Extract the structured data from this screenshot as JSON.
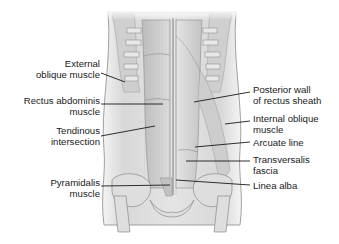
{
  "diagram": {
    "colors": {
      "background": "#ffffff",
      "muscle_light": "#e6e6e6",
      "muscle_mid": "#c9c9c9",
      "muscle_dark": "#9a9a9a",
      "outline": "#7a7a7a",
      "leader_line": "#1a1a1a",
      "text": "#1a1a1a"
    },
    "left_labels": [
      {
        "line1": "External",
        "line2": "oblique muscle"
      },
      {
        "line1": "Rectus abdominis",
        "line2": "muscle"
      },
      {
        "line1": "Tendinous",
        "line2": "intersection"
      },
      {
        "line1": "Pyramidalis",
        "line2": "muscle"
      }
    ],
    "right_labels": [
      {
        "line1": "Posterior wall",
        "line2": "of rectus sheath"
      },
      {
        "line1": "Internal oblique",
        "line2": "muscle"
      },
      {
        "line1": "Arcuate line",
        "line2": ""
      },
      {
        "line1": "Transversalis",
        "line2": "fascia"
      },
      {
        "line1": "Linea alba",
        "line2": ""
      }
    ]
  }
}
